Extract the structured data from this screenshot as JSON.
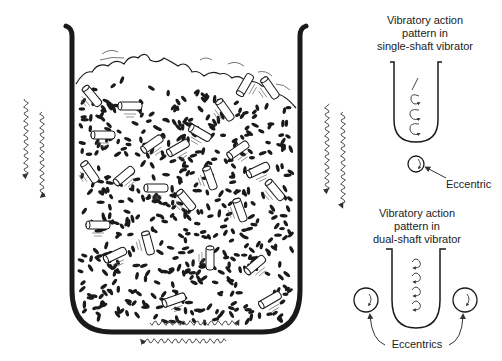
{
  "diagram": {
    "type": "vibratory finishing machine schematic",
    "main_bin": {
      "description": "Tub filled with abrasive media and parts"
    },
    "single_shaft": {
      "title_lines": [
        "Vibratory action",
        "pattern in",
        "single-shaft vibrator"
      ],
      "eccentric_label": "Eccentric"
    },
    "dual_shaft": {
      "title_lines": [
        "Vibratory action",
        "pattern in",
        "dual-shaft vibrator"
      ],
      "eccentrics_label": "Eccentrics"
    },
    "colors": {
      "ink": "#1a1a1a",
      "background": "#ffffff",
      "wave": "#555555"
    }
  }
}
